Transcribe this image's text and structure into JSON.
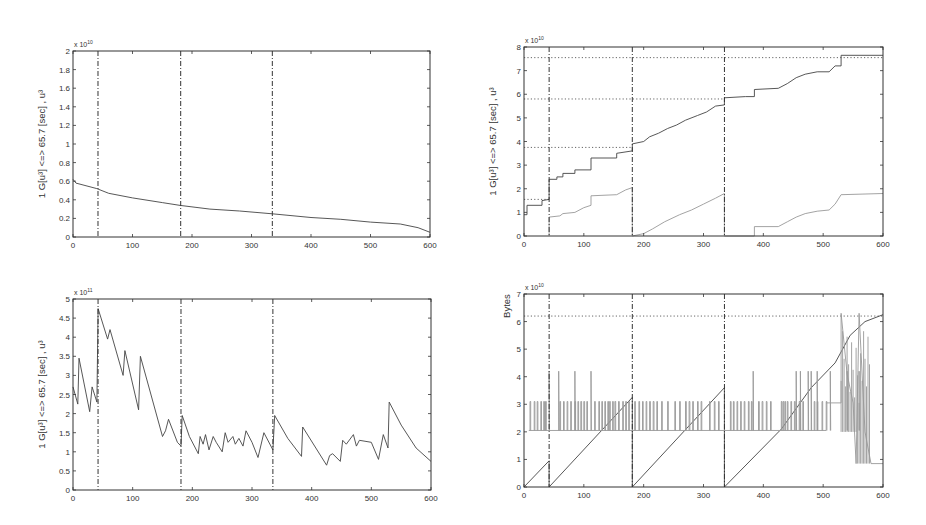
{
  "chart_data": [
    {
      "id": "top-left",
      "type": "line",
      "title": "",
      "xlabel": "",
      "ylabel": "1 G[u³] <=> 65.7 [sec] , u³",
      "y_exponent": "x 10^10",
      "xlim": [
        0,
        600
      ],
      "ylim": [
        0,
        2
      ],
      "xticks": [
        0,
        100,
        200,
        300,
        400,
        500,
        600
      ],
      "yticks": [
        0,
        0.2,
        0.4,
        0.6,
        0.8,
        1,
        1.2,
        1.4,
        1.6,
        1.8,
        2
      ],
      "vertical_markers": [
        42,
        181,
        335
      ],
      "description": "Spiky series with decaying baseline from ~0.6 to ~0.05; spikes up to ~1.88",
      "series": [
        {
          "name": "baseline",
          "x": [
            0,
            5,
            40,
            60,
            100,
            150,
            180,
            230,
            280,
            335,
            400,
            450,
            500,
            550,
            580,
            600
          ],
          "values": [
            0.62,
            0.58,
            0.52,
            0.47,
            0.42,
            0.37,
            0.34,
            0.3,
            0.28,
            0.25,
            0.21,
            0.19,
            0.16,
            0.14,
            0.1,
            0.05
          ]
        },
        {
          "name": "spikes",
          "x": [
            10,
            20,
            25,
            30,
            35,
            42,
            58,
            62,
            70,
            78,
            84,
            95,
            100,
            105,
            112,
            120,
            130,
            140,
            145,
            155,
            165,
            172,
            181,
            190,
            200,
            215,
            220,
            230,
            240,
            255,
            262,
            272,
            285,
            290,
            300,
            312,
            320,
            328,
            335,
            345,
            355,
            368,
            383,
            398,
            405,
            415,
            430,
            445,
            452,
            460,
            475,
            485,
            497,
            505,
            515,
            530,
            538,
            550,
            565,
            572,
            580
          ],
          "values": [
            1.31,
            1.14,
            1.1,
            1.07,
            1.02,
            1.88,
            1.52,
            0.98,
            0.97,
            0.97,
            1.62,
            0.97,
            0.99,
            0.92,
            1.54,
            0.87,
            0.83,
            0.87,
            0.86,
            0.82,
            0.75,
            0.74,
            0.83,
            0.72,
            0.72,
            0.75,
            0.7,
            0.68,
            0.68,
            0.63,
            0.66,
            0.68,
            0.65,
            0.62,
            0.58,
            0.63,
            0.63,
            0.63,
            0.83,
            0.53,
            0.52,
            0.51,
            0.72,
            0.47,
            0.47,
            0.43,
            0.42,
            0.58,
            0.55,
            0.65,
            0.6,
            0.61,
            0.52,
            0.36,
            0.66,
            0.96,
            0.72,
            0.48,
            0.58,
            0.47,
            0.36
          ]
        }
      ]
    },
    {
      "id": "top-right",
      "type": "line",
      "title": "",
      "xlabel": "",
      "ylabel": "1 G[u³] <=> 65.7 [sec] , u³",
      "y_exponent": "x 10^10",
      "xlim": [
        0,
        600
      ],
      "ylim": [
        0,
        8
      ],
      "xticks": [
        0,
        100,
        200,
        300,
        400,
        500,
        600
      ],
      "yticks": [
        0,
        1,
        2,
        3,
        4,
        5,
        6,
        7,
        8
      ],
      "vertical_markers": [
        42,
        181,
        335
      ],
      "horizontal_markers": [
        {
          "y": 1.55,
          "x_end": 42
        },
        {
          "y": 3.75,
          "x_end": 181
        },
        {
          "y": 5.8,
          "x_end": 335
        },
        {
          "y": 7.55,
          "x_end": 600
        }
      ],
      "series": [
        {
          "name": "cumulative-total",
          "x": [
            0,
            5,
            5,
            30,
            30,
            42,
            42,
            55,
            55,
            65,
            65,
            85,
            85,
            112,
            112,
            155,
            155,
            181,
            181,
            200,
            210,
            225,
            240,
            255,
            270,
            290,
            305,
            320,
            335,
            335,
            370,
            385,
            385,
            425,
            440,
            455,
            470,
            490,
            510,
            520,
            530,
            530,
            600
          ],
          "values": [
            0.9,
            0.9,
            1.3,
            1.3,
            1.5,
            1.55,
            2.4,
            2.4,
            2.5,
            2.5,
            2.65,
            2.65,
            2.8,
            2.8,
            3.3,
            3.3,
            3.5,
            3.6,
            3.9,
            4.0,
            4.2,
            4.35,
            4.55,
            4.7,
            4.9,
            5.1,
            5.25,
            5.5,
            5.55,
            5.85,
            5.9,
            5.9,
            6.2,
            6.25,
            6.45,
            6.7,
            6.85,
            6.95,
            6.95,
            7.2,
            7.2,
            7.65,
            7.65
          ]
        },
        {
          "name": "segment-progress",
          "x": [
            42,
            42,
            60,
            65,
            85,
            100,
            112,
            112,
            155,
            170,
            181,
            181,
            200,
            215,
            235,
            260,
            280,
            300,
            320,
            335,
            335,
            385,
            385,
            425,
            440,
            455,
            470,
            490,
            510,
            520,
            530,
            600
          ],
          "values": [
            0.0,
            0.8,
            0.85,
            0.95,
            1.0,
            1.2,
            1.3,
            1.7,
            1.75,
            1.95,
            2.05,
            0.0,
            0.1,
            0.3,
            0.6,
            0.9,
            1.1,
            1.35,
            1.6,
            1.8,
            0.0,
            0.0,
            0.4,
            0.4,
            0.6,
            0.8,
            0.95,
            1.05,
            1.1,
            1.35,
            1.75,
            1.8
          ]
        }
      ]
    },
    {
      "id": "bottom-left",
      "type": "line",
      "title": "",
      "xlabel": "",
      "ylabel": "1 G[u³] <=> 65.7 [sec] , u³",
      "y_exponent": "x 10^11",
      "xlim": [
        0,
        600
      ],
      "ylim": [
        0,
        5
      ],
      "xticks": [
        0,
        100,
        200,
        300,
        400,
        500,
        600
      ],
      "yticks": [
        0,
        0.5,
        1,
        1.5,
        2,
        2.5,
        3,
        3.5,
        4,
        4.5,
        5
      ],
      "vertical_markers": [
        42,
        181,
        335
      ],
      "series": [
        {
          "name": "sawtooth",
          "x": [
            0,
            8,
            10,
            28,
            32,
            40,
            42,
            58,
            62,
            84,
            87,
            110,
            113,
            150,
            155,
            160,
            175,
            181,
            183,
            195,
            210,
            213,
            218,
            222,
            228,
            235,
            240,
            250,
            255,
            260,
            268,
            272,
            278,
            285,
            290,
            300,
            310,
            320,
            335,
            338,
            360,
            383,
            385,
            425,
            430,
            435,
            448,
            452,
            458,
            470,
            475,
            480,
            500,
            512,
            520,
            528,
            530,
            550,
            575,
            600
          ],
          "values": [
            2.7,
            2.25,
            3.45,
            2.05,
            2.7,
            2.3,
            4.75,
            3.95,
            4.2,
            3.0,
            3.65,
            2.1,
            3.5,
            1.4,
            1.55,
            1.85,
            1.25,
            1.15,
            1.95,
            1.4,
            0.95,
            1.4,
            1.2,
            1.45,
            1.05,
            1.4,
            1.25,
            1.0,
            1.5,
            1.25,
            1.4,
            1.2,
            1.35,
            1.15,
            1.55,
            1.25,
            0.85,
            1.5,
            1.05,
            1.95,
            1.35,
            0.88,
            1.65,
            0.65,
            0.9,
            0.95,
            0.75,
            1.3,
            1.2,
            1.45,
            1.15,
            1.3,
            1.25,
            0.8,
            1.45,
            1.1,
            2.3,
            1.7,
            1.1,
            0.75
          ]
        }
      ]
    },
    {
      "id": "bottom-right",
      "type": "line",
      "title": "",
      "xlabel": "",
      "ylabel": "Bytes",
      "y_exponent": "x 10^10",
      "xlim": [
        0,
        600
      ],
      "ylim": [
        0,
        7
      ],
      "xticks": [
        0,
        100,
        200,
        300,
        400,
        500,
        600
      ],
      "yticks": [
        0,
        1,
        2,
        3,
        4,
        5,
        6,
        7
      ],
      "vertical_markers": [
        42,
        181,
        335
      ],
      "horizontal_markers": [
        {
          "y": 6.2,
          "x_end": 600
        }
      ],
      "series": [
        {
          "name": "ramp",
          "x": [
            0,
            42,
            42,
            181,
            181,
            335,
            335,
            430,
            480,
            520,
            545,
            570,
            600
          ],
          "values": [
            0.0,
            0.95,
            0.0,
            3.25,
            0.0,
            3.6,
            0.0,
            2.1,
            3.6,
            4.5,
            5.5,
            6.0,
            6.25
          ]
        },
        {
          "name": "bursts",
          "baseline": 2.05,
          "levels": [
            3.1,
            4.2
          ],
          "x_spikes_3_1": [
            10,
            17,
            22,
            28,
            33,
            36,
            60,
            66,
            72,
            78,
            85,
            90,
            95,
            100,
            105,
            118,
            125,
            130,
            135,
            140,
            143,
            148,
            152,
            158,
            165,
            170,
            175,
            185,
            192,
            198,
            204,
            210,
            216,
            222,
            230,
            240,
            252,
            260,
            270,
            276,
            282,
            290,
            296,
            310,
            318,
            325,
            345,
            350,
            356,
            362,
            368,
            375,
            380,
            392,
            398,
            405,
            412,
            430,
            433,
            436,
            440,
            446,
            452,
            460,
            466,
            485,
            490,
            498,
            505
          ],
          "x_spikes_4_2": [
            42,
            58,
            85,
            112,
            383,
            455,
            462,
            475,
            480,
            490,
            512,
            540,
            560
          ],
          "tail": {
            "x": [
              505,
              530,
              530,
              540,
              550,
              555,
              560,
              570,
              580,
              600
            ],
            "values": [
              3.05,
              3.05,
              6.3,
              4.1,
              3.05,
              0.85,
              6.3,
              2.0,
              0.85,
              0.85
            ]
          }
        }
      ]
    }
  ]
}
